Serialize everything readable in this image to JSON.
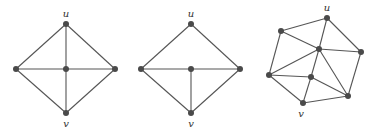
{
  "figure": {
    "graphs": [
      {
        "id": "graph-1",
        "nodes": {
          "u": [
            66,
            24
          ],
          "left": [
            16,
            69
          ],
          "center": [
            66,
            69
          ],
          "right": [
            115,
            69
          ],
          "v": [
            66,
            113
          ]
        },
        "edges": [
          [
            "u",
            "left"
          ],
          [
            "u",
            "right"
          ],
          [
            "left",
            "v"
          ],
          [
            "right",
            "v"
          ],
          [
            "left",
            "right"
          ],
          [
            "u",
            "v"
          ]
        ],
        "labels": [
          {
            "node": "u",
            "text": "u",
            "dx": 0,
            "dy": -7
          },
          {
            "node": "v",
            "text": "v",
            "dx": 0,
            "dy": 14
          }
        ]
      },
      {
        "id": "graph-2",
        "nodes": {
          "u": [
            191,
            24
          ],
          "left": [
            141,
            69
          ],
          "center": [
            191,
            69
          ],
          "right": [
            240,
            69
          ],
          "v": [
            191,
            113
          ]
        },
        "edges": [
          [
            "u",
            "left"
          ],
          [
            "u",
            "right"
          ],
          [
            "left",
            "v"
          ],
          [
            "right",
            "v"
          ],
          [
            "left",
            "right"
          ],
          [
            "center",
            "v"
          ]
        ],
        "labels": [
          {
            "node": "u",
            "text": "u",
            "dx": 0,
            "dy": -7
          },
          {
            "node": "v",
            "text": "v",
            "dx": 0,
            "dy": 14
          }
        ]
      },
      {
        "id": "graph-3",
        "nodes": {
          "u": [
            327,
            18
          ],
          "tl": [
            281,
            31
          ],
          "c": [
            319,
            49
          ],
          "r": [
            361,
            52
          ],
          "l": [
            269,
            75
          ],
          "m": [
            311,
            77
          ],
          "br": [
            348,
            96
          ],
          "v": [
            303,
            103
          ]
        },
        "edges": [
          [
            "u",
            "tl"
          ],
          [
            "u",
            "c"
          ],
          [
            "u",
            "r"
          ],
          [
            "tl",
            "c"
          ],
          [
            "tl",
            "l"
          ],
          [
            "c",
            "r"
          ],
          [
            "c",
            "l"
          ],
          [
            "c",
            "m"
          ],
          [
            "c",
            "br"
          ],
          [
            "r",
            "br"
          ],
          [
            "l",
            "m"
          ],
          [
            "l",
            "v"
          ],
          [
            "m",
            "v"
          ],
          [
            "m",
            "br"
          ],
          [
            "v",
            "br"
          ]
        ],
        "labels": [
          {
            "node": "u",
            "text": "u",
            "dx": 0,
            "dy": -7
          },
          {
            "node": "v",
            "text": "v",
            "dx": -2,
            "dy": 14
          }
        ]
      }
    ]
  }
}
